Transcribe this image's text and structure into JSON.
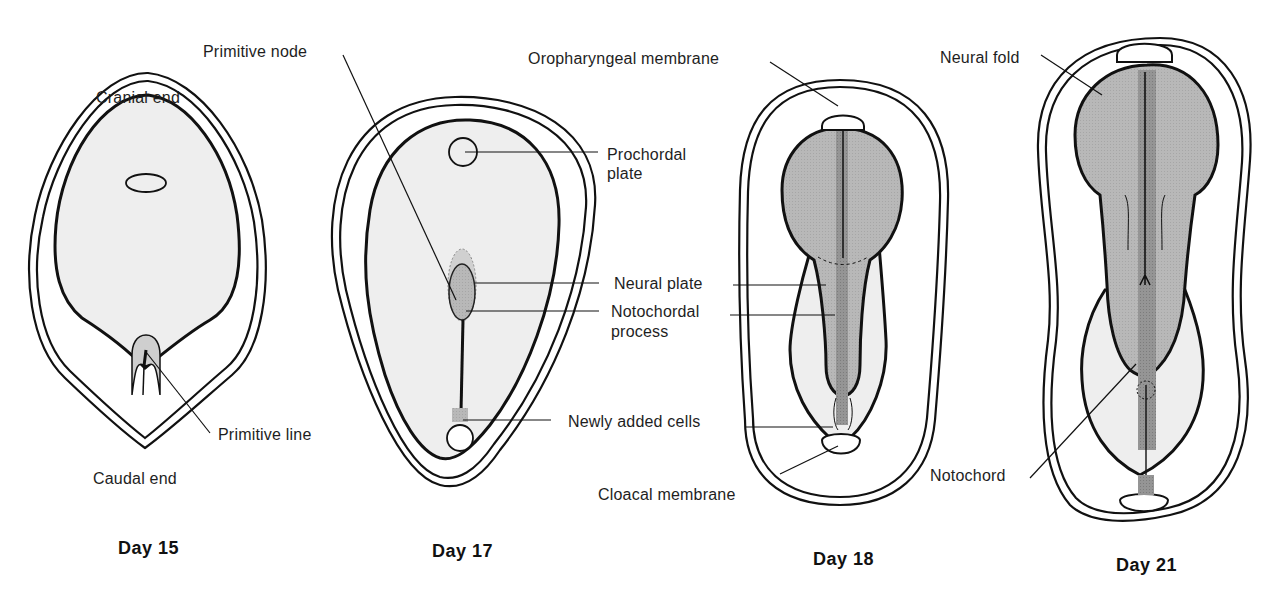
{
  "figure": {
    "type": "diagram",
    "colors": {
      "line": "#111111",
      "embryo_fill": "#eeeeee",
      "neural_fill": "#b9b9b9",
      "notochord_fill": "#8f8f8f",
      "background": "#ffffff"
    },
    "panels": [
      {
        "id": "day15",
        "title": "Day 15",
        "labels": {
          "top": "Cranial end",
          "bottom": "Caudal end",
          "primitive_line": "Primitive line"
        }
      },
      {
        "id": "day17",
        "title": "Day 17",
        "labels": {
          "primitive_node": "Primitive node",
          "prochordal_plate_1": "Prochordal",
          "prochordal_plate_2": "plate",
          "neural_plate": "Neural plate",
          "notochordal_process_1": "Notochordal",
          "notochordal_process_2": "process",
          "newly_added_cells": "Newly added cells"
        }
      },
      {
        "id": "day18",
        "title": "Day 18",
        "labels": {
          "oropharyngeal_membrane": "Oropharyngeal membrane",
          "cloacal_membrane": "Cloacal membrane"
        }
      },
      {
        "id": "day21",
        "title": "Day 21",
        "labels": {
          "neural_fold": "Neural fold",
          "notochord": "Notochord"
        }
      }
    ]
  }
}
